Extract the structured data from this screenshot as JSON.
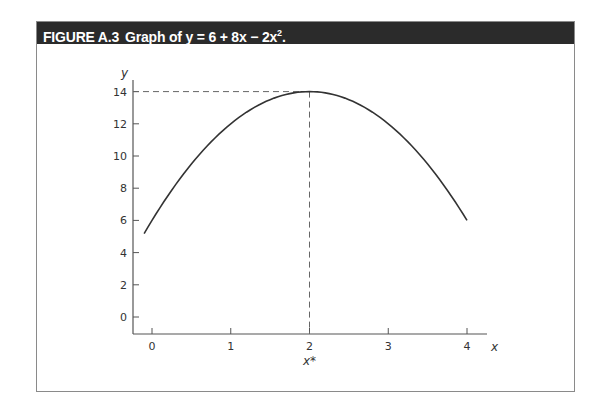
{
  "figure": {
    "label": "FIGURE A.3",
    "title_prefix": "Graph of ",
    "equation": "y = 6 + 8x − 2x",
    "equation_exponent": "2",
    "equation_suffix": "."
  },
  "chart_data": {
    "type": "line",
    "function": "y = 6 + 8x - 2x^2",
    "xlabel": "x",
    "ylabel": "y",
    "x_ticks": [
      0,
      1,
      2,
      3,
      4
    ],
    "y_ticks": [
      0,
      2,
      4,
      6,
      8,
      10,
      12,
      14
    ],
    "xlim": [
      -0.25,
      4.3
    ],
    "ylim": [
      -1,
      15.5
    ],
    "grid": false,
    "x": [
      0,
      0.5,
      1,
      1.5,
      2,
      2.5,
      3,
      3.5,
      4
    ],
    "series": [
      {
        "name": "y = 6 + 8x − 2x²",
        "values": [
          6,
          9.5,
          12,
          13.5,
          14,
          13.5,
          12,
          9.5,
          6
        ]
      }
    ],
    "annotations": [
      {
        "type": "dashed-horizontal",
        "y": 14,
        "from_x": 0,
        "to_x": 2
      },
      {
        "type": "dashed-vertical",
        "x": 2,
        "from_y": 0,
        "to_y": 14
      },
      {
        "type": "label",
        "text": "x*",
        "at_x": 2,
        "position": "below-axis"
      }
    ],
    "maximum": {
      "x": 2,
      "y": 14,
      "label": "x*"
    }
  },
  "axes": {
    "x_label": "x",
    "y_label": "y",
    "x_star_label": "x*",
    "x_tick_labels": [
      "0",
      "1",
      "2",
      "3",
      "4"
    ],
    "y_tick_labels": [
      "0",
      "2",
      "4",
      "6",
      "8",
      "10",
      "12",
      "14"
    ]
  }
}
